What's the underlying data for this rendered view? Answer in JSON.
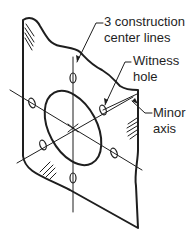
{
  "diagram": {
    "labels": {
      "construction_lines_1": "3 construction",
      "construction_lines_2": "center lines",
      "witness_1": "Witness",
      "witness_2": "hole",
      "minor_1": "Minor",
      "minor_2": "axis"
    },
    "colors": {
      "stroke": "#1e1e1e",
      "background": "#ffffff"
    }
  }
}
